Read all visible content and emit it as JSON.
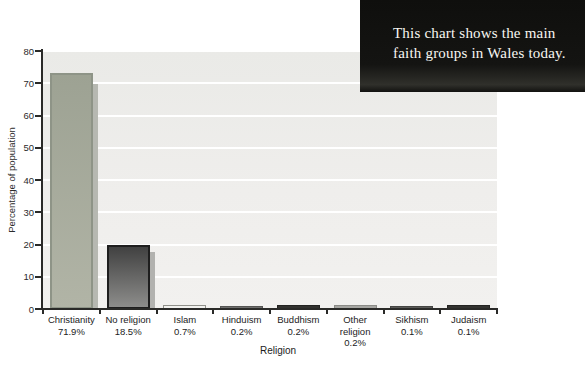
{
  "page": {
    "background_color": "#ffffff"
  },
  "info_box": {
    "lines": [
      "This chart shows the main",
      "faith groups in Wales today."
    ],
    "bg_color": "#131310",
    "text_color": "#f8f7f2"
  },
  "chart_data": {
    "type": "bar",
    "title": "Main faith groups in Wales",
    "xlabel": "Religion",
    "ylabel": "Percentage of population",
    "ylim": [
      0,
      80
    ],
    "yticks": [
      0,
      10,
      20,
      30,
      40,
      50,
      60,
      70,
      80
    ],
    "grid": "horizontal white gridlines every 10",
    "legend": "none",
    "categories": [
      "Christianity",
      "No religion",
      "Islam",
      "Hinduism",
      "Buddhism",
      "Other religion",
      "Sikhism",
      "Judaism"
    ],
    "values": [
      71.9,
      18.5,
      0.7,
      0.2,
      0.2,
      0.2,
      0.1,
      0.1
    ],
    "value_labels": [
      "71.9%",
      "18.5%",
      "0.7%",
      "0.2%",
      "0.2%",
      "0.2%",
      "0.1%",
      "0.1%"
    ],
    "category_display": [
      "Christianity",
      "No religion",
      "Islam",
      "Hinduism",
      "Buddhism",
      "Other\nreligion",
      "Sikhism",
      "Judaism"
    ],
    "plot_bg_top": "#eaeae7",
    "plot_bg_bottom": "#f2f1ef",
    "axis_color": "#2a2a28",
    "gridline_color": "#ffffff",
    "bar_styles": [
      {
        "fill_top": "#9da293",
        "fill_bottom": "#b1b4a6",
        "border": "#8e9487",
        "border_width": 2,
        "shadow": "#b6b8b1",
        "shadow_drop": 11,
        "min_height": 0
      },
      {
        "fill_top": "#414141",
        "fill_bottom": "#8d8d8b",
        "border": "#1e1e1e",
        "border_width": 2,
        "shadow": "#b2b2af",
        "shadow_drop": 7,
        "min_height": 0
      },
      {
        "fill_top": "#f2f2ef",
        "fill_bottom": "#f2f2ef",
        "border": "#90908a",
        "border_width": 1,
        "min_height": 2.5
      },
      {
        "fill_top": "#6e6e6c",
        "fill_bottom": "#6e6e6c",
        "border": "#555553",
        "border_width": 1,
        "min_height": 1.4
      },
      {
        "fill_top": "#32322f",
        "fill_bottom": "#32322f",
        "border": "#232321",
        "border_width": 1,
        "min_height": 1.8
      },
      {
        "fill_top": "#a7a7a3",
        "fill_bottom": "#a7a7a3",
        "border": "#8b8b87",
        "border_width": 1,
        "min_height": 2.0
      },
      {
        "fill_top": "#5a5a57",
        "fill_bottom": "#5a5a57",
        "border": "#454543",
        "border_width": 1,
        "min_height": 1.2
      },
      {
        "fill_top": "#333330",
        "fill_bottom": "#333330",
        "border": "#242422",
        "border_width": 1,
        "min_height": 1.6
      }
    ]
  }
}
